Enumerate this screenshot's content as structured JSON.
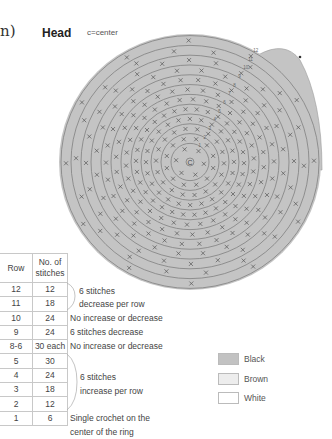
{
  "header": {
    "paren_fragment": "n)",
    "title": "Head",
    "key": "c=center"
  },
  "diagram": {
    "center_label": "C",
    "row_numbers": [
      "1",
      "2",
      "3",
      "4",
      "5",
      "6",
      "7",
      "8",
      "9",
      "10",
      "11",
      "12"
    ],
    "fill_color": "#c4c4c4",
    "line_color": "#7a7a7a",
    "stitch_symbol": "×"
  },
  "table": {
    "headers": {
      "row": "Row",
      "stitches_line1": "No. of",
      "stitches_line2": "stitches"
    },
    "rows": [
      {
        "row": "12",
        "stitches": "12"
      },
      {
        "row": "11",
        "stitches": "18"
      },
      {
        "row": "10",
        "stitches": "24"
      },
      {
        "row": "9",
        "stitches": "24"
      },
      {
        "row": "8-6",
        "stitches": "30 each"
      },
      {
        "row": "5",
        "stitches": "30"
      },
      {
        "row": "4",
        "stitches": "24"
      },
      {
        "row": "3",
        "stitches": "18"
      },
      {
        "row": "2",
        "stitches": "12"
      },
      {
        "row": "1",
        "stitches": "6"
      }
    ]
  },
  "notes": {
    "decrease_line1": "6 stitches",
    "decrease_line2": "decrease per row",
    "row10": "No increase or decrease",
    "row9": "6 stitches decrease",
    "row8_6": "No increase or decrease",
    "increase_line1": "6 stitches",
    "increase_line2": "increase per row",
    "row1_line1": "Single crochet on the",
    "row1_line2": "center of the ring"
  },
  "legend": [
    {
      "label": "Black",
      "color": "#c2c2c2"
    },
    {
      "label": "Brown",
      "color": "#ededed"
    },
    {
      "label": "White",
      "color": "#ffffff"
    }
  ]
}
